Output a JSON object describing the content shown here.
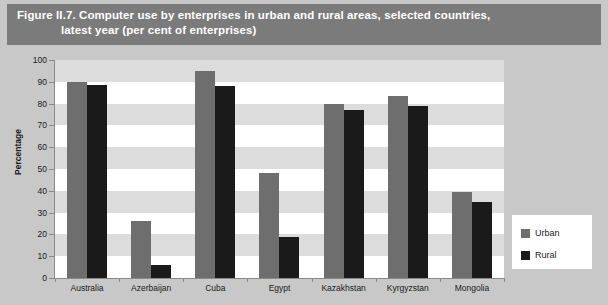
{
  "figure": {
    "title_line_1": "Figure II.7. Computer use by enterprises in urban and rural areas, selected countries,",
    "title_line_2": "latest year (per cent of enterprises)"
  },
  "legend": {
    "position": "bottom-right",
    "entries": [
      {
        "label": "Urban",
        "color": "#6e6e6e",
        "swatch_name": "legend-swatch-urban"
      },
      {
        "label": "Rural",
        "color": "#1a1a1a",
        "swatch_name": "legend-swatch-rural"
      }
    ]
  },
  "chart_data": {
    "type": "bar",
    "title": "Figure II.7. Computer use by enterprises in urban and rural areas, selected countries, latest year (per cent of enterprises)",
    "xlabel": "",
    "ylabel": "Percentage",
    "ylim": [
      0,
      100
    ],
    "ytick_step": 10,
    "yticks": [
      0,
      10,
      20,
      30,
      40,
      50,
      60,
      70,
      80,
      90,
      100
    ],
    "ytick_labels": [
      "0",
      "10",
      "20",
      "30",
      "40",
      "50",
      "60",
      "70",
      "80",
      "90",
      "100"
    ],
    "grid": "alternating horizontal bands",
    "legend_position": "bottom-right",
    "categories": [
      "Australia",
      "Azerbaijan",
      "Cuba",
      "Egypt",
      "Kazakhstan",
      "Kyrgyzstan",
      "Mongolia"
    ],
    "series": [
      {
        "name": "Urban",
        "color": "#6e6e6e",
        "values": [
          90,
          26,
          95,
          48,
          80,
          83.5,
          39.5
        ]
      },
      {
        "name": "Rural",
        "color": "#1a1a1a",
        "values": [
          88.5,
          6,
          88,
          19,
          77,
          79,
          35
        ]
      }
    ]
  },
  "colors": {
    "page_background": "#c8c8c8",
    "title_band": "#7b7b7b",
    "title_text": "#ffffff",
    "plot_background": "#ffffff",
    "band_stripe": "#dcdcdc",
    "axis_line": "#8a8a8a",
    "urban": "#6e6e6e",
    "rural": "#1a1a1a"
  }
}
